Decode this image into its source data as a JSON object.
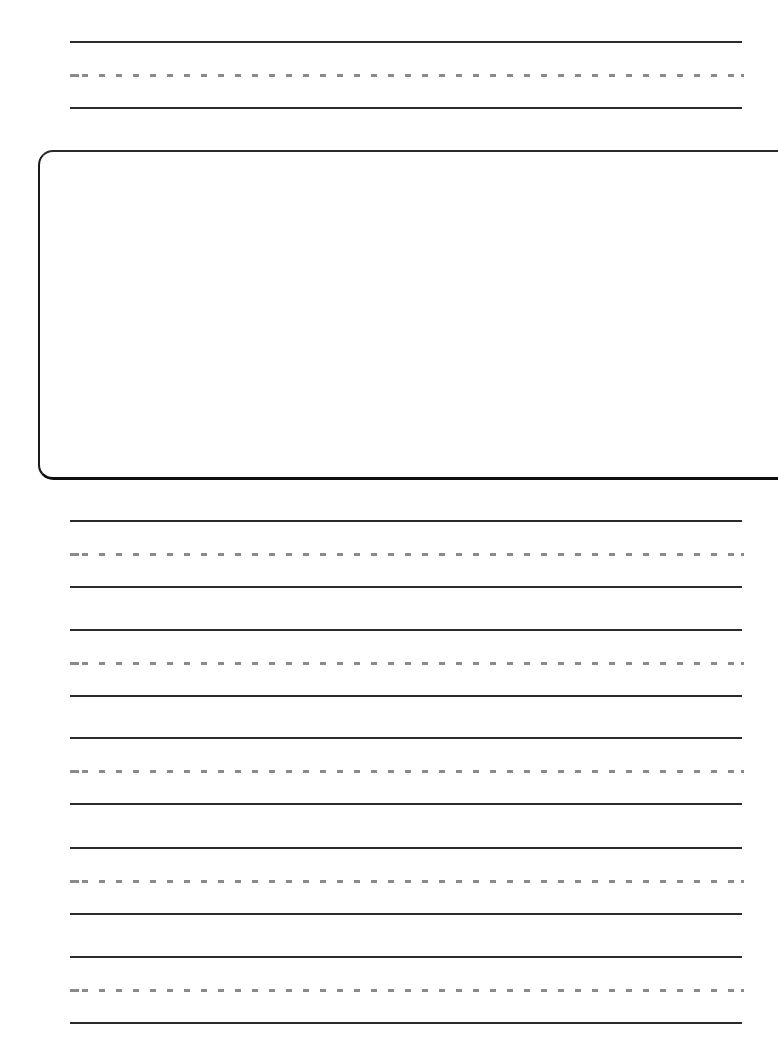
{
  "page": {
    "type": "handwriting-practice-sheet",
    "background_color": "#ffffff",
    "solid_line_color": "#2b2b2b",
    "dashed_line_color": "#8a8a8a",
    "box_border_color": "#1a1a1a"
  },
  "top_writing_row": {
    "label": "",
    "solid_top_y": 42,
    "dashed_mid_y": 76,
    "solid_bottom_y": 109
  },
  "drawing_box": {
    "label": "",
    "left": 38,
    "top": 150,
    "bottom": 481,
    "corner_radius": 15
  },
  "writing_rows": [
    {
      "label": "",
      "solid_top_y": 521,
      "dashed_mid_y": 554,
      "solid_bottom_y": 588
    },
    {
      "label": "",
      "solid_top_y": 630,
      "dashed_mid_y": 663,
      "solid_bottom_y": 697
    },
    {
      "label": "",
      "solid_top_y": 738,
      "dashed_mid_y": 772,
      "solid_bottom_y": 806
    },
    {
      "label": "",
      "solid_top_y": 848,
      "dashed_mid_y": 882,
      "solid_bottom_y": 915
    },
    {
      "label": "",
      "solid_top_y": 957,
      "dashed_mid_y": 991,
      "solid_bottom_y": 1024
    }
  ]
}
